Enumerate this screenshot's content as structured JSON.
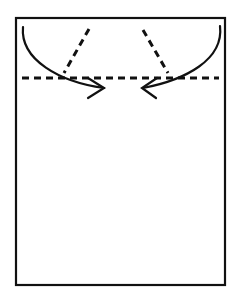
{
  "diagram": {
    "type": "paper-folding-instruction",
    "canvas": {
      "width": 237,
      "height": 296,
      "background": "#ffffff"
    },
    "stroke_color": "#111111",
    "paper": {
      "x": 16,
      "y": 18,
      "width": 209,
      "height": 267,
      "stroke_width": 2.2
    },
    "fold_lines": [
      {
        "name": "horizontal-fold",
        "x1": 22,
        "y1": 78,
        "x2": 219,
        "y2": 78,
        "dash": "7 5",
        "width": 3
      },
      {
        "name": "left-diagonal-fold",
        "x1": 89,
        "y1": 29,
        "x2": 64,
        "y2": 73,
        "dash": "7 5",
        "width": 3
      },
      {
        "name": "right-diagonal-fold",
        "x1": 143,
        "y1": 30,
        "x2": 168,
        "y2": 73,
        "dash": "7 5",
        "width": 3
      }
    ],
    "arrows": [
      {
        "name": "left-fold-arrow",
        "path": "M23,27 C20,60 60,82 104,88",
        "head": "M88,78 L104,88 L88,98"
      },
      {
        "name": "right-fold-arrow",
        "path": "M220,26 C224,60 185,80 143,88",
        "head": "M157,78 L142,88 L156,98"
      }
    ]
  }
}
